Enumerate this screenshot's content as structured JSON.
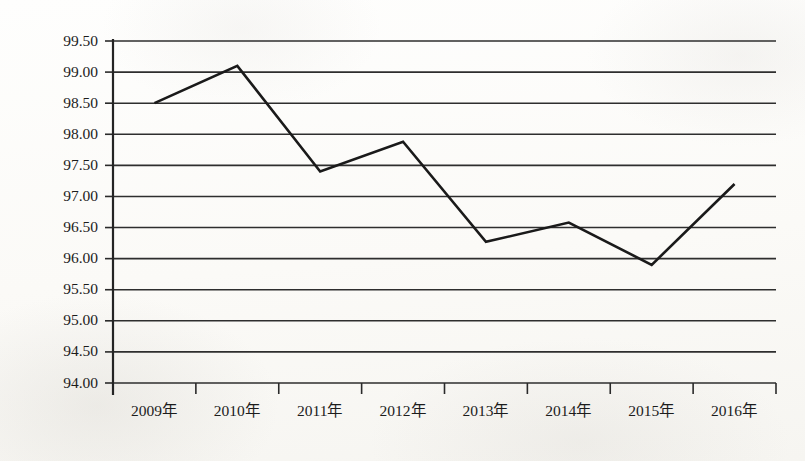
{
  "chart_data": {
    "type": "line",
    "title": "",
    "subtitle": "",
    "xlabel": "",
    "ylabel": "",
    "categories": [
      "2009年",
      "2010年",
      "2011年",
      "2012年",
      "2013年",
      "2014年",
      "2015年",
      "2016年"
    ],
    "values": [
      98.5,
      99.1,
      97.4,
      97.88,
      96.27,
      96.58,
      95.9,
      97.2
    ],
    "ylim": [
      94.0,
      99.5
    ],
    "ytick_labels": [
      "99.50",
      "99.00",
      "98.50",
      "98.00",
      "97.50",
      "97.00",
      "96.50",
      "96.00",
      "95.50",
      "95.00",
      "94.50",
      "94.00"
    ],
    "ytick_values": [
      99.5,
      99.0,
      98.5,
      98.0,
      97.5,
      97.0,
      96.5,
      96.0,
      95.5,
      95.0,
      94.5,
      94.0
    ],
    "grid": true,
    "legend": [],
    "legend_position": "none",
    "annotations": [],
    "series_color": "#1a1a1a",
    "grid_color": "#2e2e2e",
    "background_color": "#fdfdfb"
  }
}
